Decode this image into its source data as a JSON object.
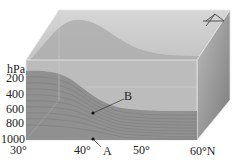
{
  "diagram": {
    "y_axis": {
      "unit": "hPa",
      "ticks": [
        "200",
        "400",
        "600",
        "800",
        "1000"
      ]
    },
    "x_axis": {
      "ticks": [
        "30°",
        "40°",
        "50°",
        "60°N"
      ]
    },
    "points": [
      {
        "label": "A"
      },
      {
        "label": "B"
      }
    ],
    "symbol": "front-symbol",
    "colors": {
      "box_top": "#c4c4c4",
      "box_front_upper": "#b8b8b8",
      "box_front_lower": "#8f8f8f",
      "box_side": "#9a9a9a",
      "layer_lines": "#7d7d7d",
      "label": "#222222"
    }
  }
}
